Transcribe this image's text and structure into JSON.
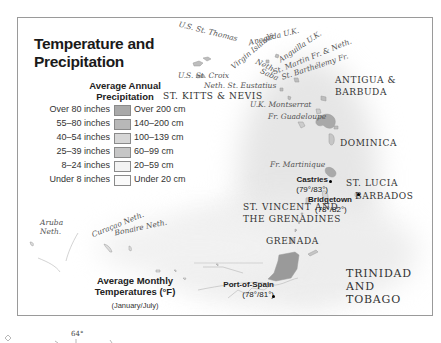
{
  "map": {
    "title": "Temperature and Precipitation",
    "title_line1": "Temperature and",
    "title_line2": "Precipitation",
    "precip_legend": {
      "title_line1": "Average Annual",
      "title_line2": "Precipitation",
      "rows": [
        {
          "inches": "Over 80 inches",
          "cm": "Over 200 cm",
          "color": "#a9a9a9"
        },
        {
          "inches": "55–80 inches",
          "cm": "140–200 cm",
          "color": "#b8b8b8"
        },
        {
          "inches": "40–54 inches",
          "cm": "100–139 cm",
          "color": "#d6d6d6"
        },
        {
          "inches": "25–39 inches",
          "cm": "60–99 cm",
          "color": "#c6c6c6"
        },
        {
          "inches": "8–24 inches",
          "cm": "20–59 cm",
          "color": "#f2f2f2"
        },
        {
          "inches": "Under 8 inches",
          "cm": "Under 20 cm",
          "color": "#fafafa"
        }
      ]
    },
    "temp_legend": {
      "title_line1": "Average Monthly",
      "title_line2": "Temperatures (°F)",
      "subtitle": "(January/July)"
    },
    "territory_labels": {
      "us_st_thomas": "U.S. St. Thomas",
      "anegada": "Anegada U.K.",
      "virgin_islands": "Virgin Islands",
      "anguilla": "Anguilla U.K.",
      "st_martin": "St. Martin Fr. & Neth.",
      "st_barthelemy": "St. Barthélemy Fr.",
      "us_st_croix": "U.S. St. Croix",
      "neth_saba_1": "Neth.",
      "neth_saba_2": "Saba",
      "neth_st_eustatius": "Neth. St. Eustatius",
      "uk_montserrat": "U.K. Montserrat",
      "fr_guadeloupe": "Fr. Guadeloupe",
      "fr_martinique": "Fr. Martinique",
      "aruba_1": "Aruba",
      "aruba_2": "Neth.",
      "curacao": "Curaçao Neth.",
      "bonaire": "Bonaire Neth."
    },
    "country_labels": {
      "st_kitts_nevis": "ST. KITTS & NEVIS",
      "antigua_1": "ANTIGUA &",
      "antigua_2": "BARBUDA",
      "dominica": "DOMINICA",
      "st_lucia": "ST. LUCIA",
      "barbados": "BARBADOS",
      "st_vincent_1": "ST. VINCENT AND",
      "st_vincent_2": "THE GRENADINES",
      "grenada": "GRENADA",
      "trinidad_1": "TRINIDAD",
      "trinidad_2": "AND",
      "trinidad_3": "TOBAGO"
    },
    "cities": [
      {
        "name": "Castries",
        "temps": "(79°/83°)"
      },
      {
        "name": "Bridgetown",
        "temps": "(78°/82°)"
      },
      {
        "name": "Port-of-Spain",
        "temps": "(78°/81°)"
      }
    ],
    "below_frame": {
      "longitude_label": "64°"
    }
  }
}
